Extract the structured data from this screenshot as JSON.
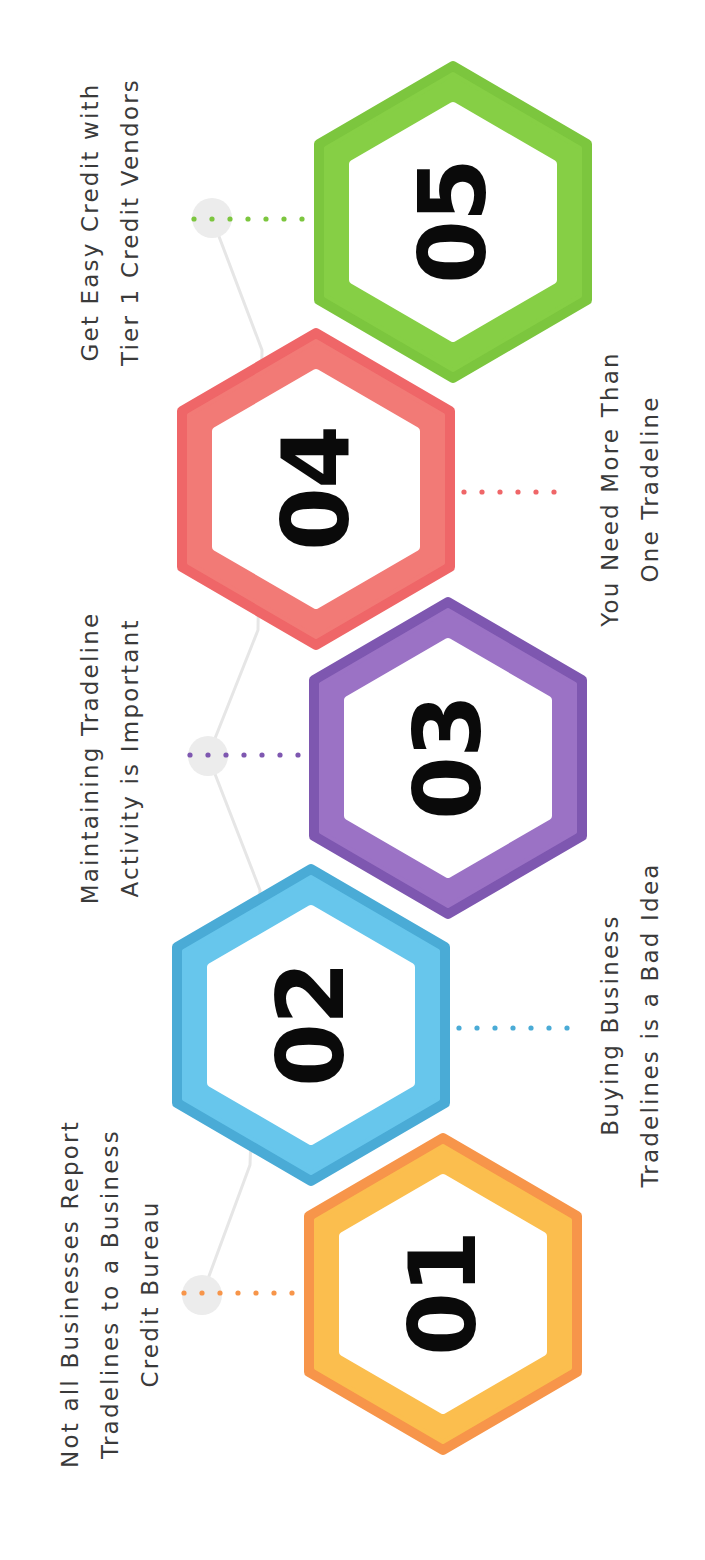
{
  "orientation": "rotated-counterclockwise-90",
  "connector_color": "#e6e6e6",
  "steps": [
    {
      "number": "01",
      "caption_lines": [
        "Not all Businesses Report",
        "Tradelines to a Business",
        "Credit Bureau"
      ],
      "caption_side": "left",
      "outer_color": "#f7954a",
      "band_color": "#fbbe4e"
    },
    {
      "number": "02",
      "caption_lines": [
        "Buying Business",
        "Tradelines is a Bad Idea"
      ],
      "caption_side": "right",
      "outer_color": "#4aabd6",
      "band_color": "#67c6ec"
    },
    {
      "number": "03",
      "caption_lines": [
        "Maintaining Tradeline",
        "Activity is Important"
      ],
      "caption_side": "left",
      "outer_color": "#7e57b0",
      "band_color": "#9b72c5"
    },
    {
      "number": "04",
      "caption_lines": [
        "You Need More Than",
        "One Tradeline"
      ],
      "caption_side": "right",
      "outer_color": "#ef6668",
      "band_color": "#f27a76"
    },
    {
      "number": "05",
      "caption_lines": [
        "Get Easy Credit with",
        "Tier 1 Credit Vendors"
      ],
      "caption_side": "left",
      "outer_color": "#7cc63e",
      "band_color": "#86cf45"
    }
  ]
}
